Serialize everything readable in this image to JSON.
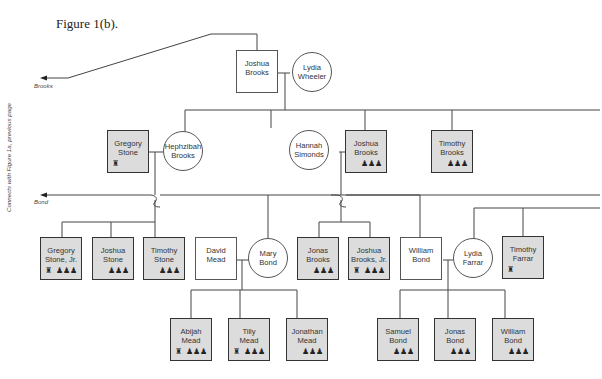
{
  "figure": {
    "title": "Figure 1(b).",
    "side_label": "Connects with Figure 1a, previous page",
    "arrows": {
      "brooks": "Brooks",
      "bond": "Bond"
    }
  },
  "icon_legend": {
    "soldier_icon": "♜",
    "family_icon": "♟♟♟"
  },
  "nodes": {
    "joshua_brooks_sr": {
      "name": "Joshua Brooks",
      "l1": "Joshua",
      "l2": "Brooks"
    },
    "lydia_wheeler": {
      "name": "Lydia Wheeler",
      "l1": "Lydia",
      "l2": "Wheeler"
    },
    "gregory_stone": {
      "l1": "Gregory",
      "l2": "Stone"
    },
    "hephzibah_brooks": {
      "l1": "Hephzibah",
      "l2": "Brooks"
    },
    "hannah_simonds": {
      "l1": "Hannah",
      "l2": "Simonds"
    },
    "joshua_brooks": {
      "l1": "Joshua",
      "l2": "Brooks"
    },
    "timothy_brooks": {
      "l1": "Timothy",
      "l2": "Brooks"
    },
    "gregory_stone_jr": {
      "l1": "Gregory",
      "l2": "Stone, Jr."
    },
    "joshua_stone": {
      "l1": "Joshua",
      "l2": "Stone"
    },
    "timothy_stone": {
      "l1": "Timothy",
      "l2": "Stone"
    },
    "david_mead": {
      "l1": "David",
      "l2": "Mead"
    },
    "mary_bond": {
      "l1": "Mary",
      "l2": "Bond"
    },
    "jonas_brooks": {
      "l1": "Jonas",
      "l2": "Brooks"
    },
    "joshua_brooks_jr": {
      "l1": "Joshua",
      "l2": "Brooks, Jr."
    },
    "william_bond_sr": {
      "l1": "William",
      "l2": "Bond"
    },
    "lydia_farrar": {
      "l1": "Lydia",
      "l2": "Farrar"
    },
    "timothy_farrar": {
      "l1": "Timothy",
      "l2": "Farrar"
    },
    "abijah_mead": {
      "l1": "Abijah",
      "l2": "Mead"
    },
    "tilly_mead": {
      "l1": "Tilly",
      "l2": "Mead"
    },
    "jonathan_mead": {
      "l1": "Jonathan",
      "l2": "Mead"
    },
    "samuel_bond": {
      "l1": "Samuel",
      "l2": "Bond"
    },
    "jonas_bond": {
      "l1": "Jonas",
      "l2": "Bond"
    },
    "william_bond": {
      "l1": "William",
      "l2": "Bond"
    }
  }
}
